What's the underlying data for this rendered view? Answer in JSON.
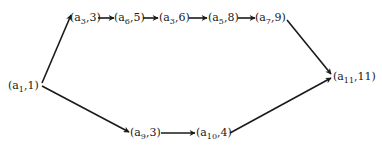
{
  "diagram": {
    "type": "directed-graph",
    "nodes": [
      {
        "id": "n1",
        "symbol": "a",
        "sub": "1",
        "value": "1",
        "x": 8,
        "y": 89
      },
      {
        "id": "n2",
        "symbol": "a",
        "sub": "3",
        "value": "3",
        "x": 70,
        "y": 21
      },
      {
        "id": "n3",
        "symbol": "a",
        "sub": "6",
        "value": "5",
        "x": 114,
        "y": 21
      },
      {
        "id": "n4",
        "symbol": "a",
        "sub": "3",
        "value": "6",
        "x": 159,
        "y": 21
      },
      {
        "id": "n5",
        "symbol": "a",
        "sub": "5",
        "value": "8",
        "x": 208,
        "y": 21
      },
      {
        "id": "n6",
        "symbol": "a",
        "sub": "7",
        "value": "9",
        "x": 255,
        "y": 21
      },
      {
        "id": "n7",
        "symbol": "a",
        "sub": "11",
        "value": "11",
        "x": 333,
        "y": 80
      },
      {
        "id": "n8",
        "symbol": "a",
        "sub": "9",
        "value": "3",
        "x": 130,
        "y": 136
      },
      {
        "id": "n9",
        "symbol": "a",
        "sub": "10",
        "value": "4",
        "x": 196,
        "y": 136
      }
    ],
    "edges": [
      {
        "from": "n1",
        "to": "n2"
      },
      {
        "from": "n2",
        "to": "n3"
      },
      {
        "from": "n3",
        "to": "n4"
      },
      {
        "from": "n4",
        "to": "n5"
      },
      {
        "from": "n5",
        "to": "n6"
      },
      {
        "from": "n6",
        "to": "n7"
      },
      {
        "from": "n1",
        "to": "n8"
      },
      {
        "from": "n8",
        "to": "n9"
      },
      {
        "from": "n9",
        "to": "n7"
      }
    ],
    "labels": {
      "n1": {
        "open": "(a",
        "sub": "1",
        "rest": ",1)"
      },
      "n2": {
        "open": "(a",
        "sub": "3",
        "rest": ",3)"
      },
      "n3": {
        "open": "(a",
        "sub": "6",
        "rest": ",5)"
      },
      "n4": {
        "open": "(a",
        "sub": "3",
        "rest": ",6)"
      },
      "n5": {
        "open": "(a",
        "sub": "5",
        "rest": ",8)"
      },
      "n6": {
        "open": "(a",
        "sub": "7",
        "rest": ",9)"
      },
      "n7": {
        "open": "(a",
        "sub": "11",
        "rest": ",11)"
      },
      "n8": {
        "open": "(a",
        "sub": "9",
        "rest": ",3)"
      },
      "n9": {
        "open": "(a",
        "sub": "10",
        "rest": ",4)"
      }
    }
  }
}
